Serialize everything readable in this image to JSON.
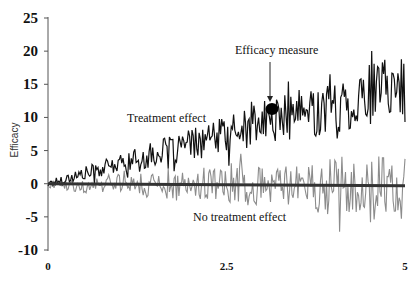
{
  "chart_data": {
    "type": "line",
    "title": "",
    "xlabel": "",
    "ylabel": "Efficacy",
    "xlim": [
      0,
      5
    ],
    "ylim": [
      -10,
      25
    ],
    "xticks": [
      "0",
      "2.5",
      "5"
    ],
    "yticks": [
      "25",
      "20",
      "15",
      "10",
      "5",
      "0",
      "-5",
      "-10"
    ],
    "grid": false,
    "legend": "none (inline annotations)",
    "series": [
      {
        "name": "Treatment effect",
        "color": "#111111",
        "trend": {
          "start": 0,
          "end": 14.5
        },
        "noise_amplitude_end": 4.5,
        "x": [
          0,
          0.5,
          1.0,
          1.5,
          2.0,
          2.5,
          3.0,
          3.5,
          4.0,
          4.5,
          4.8,
          5.0
        ],
        "values": [
          0,
          1.5,
          3,
          4.5,
          6,
          7.5,
          10,
          11,
          11.5,
          13.5,
          17,
          13
        ]
      },
      {
        "name": "No treatment effect",
        "color": "#8c8c8c",
        "trend": {
          "start": 0,
          "end": 0
        },
        "noise_amplitude_end": 5,
        "x": [
          0,
          0.5,
          1.0,
          1.5,
          2.0,
          2.5,
          3.0,
          3.5,
          4.0,
          4.5,
          5.0
        ],
        "values": [
          0,
          -1,
          1.5,
          -1,
          2,
          -1.5,
          1,
          -3,
          2,
          -4,
          1
        ]
      },
      {
        "name": "Baseline",
        "color": "#333333",
        "x": [
          0,
          5
        ],
        "values": [
          0,
          -0.3
        ]
      }
    ],
    "annotations": [
      {
        "text": "Efficacy measure",
        "arrow_to": {
          "x": 3.16,
          "y": 11.2
        },
        "marker": "filled circle"
      },
      {
        "text": "Treatment effect",
        "near": {
          "x": 1.3,
          "y": 10
        }
      },
      {
        "text": "No treatment effect",
        "near": {
          "x": 2.5,
          "y": -5
        }
      }
    ]
  },
  "labels": {
    "ylabel": "Efficacy",
    "efficacy_measure": "Efficacy measure",
    "treatment_effect": "Treatment effect",
    "no_treatment_effect": "No treatment effect"
  },
  "noise": {
    "seed_treat": 17,
    "seed_none": 91,
    "points": 300
  }
}
